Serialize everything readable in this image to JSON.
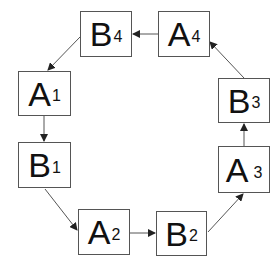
{
  "diagram": {
    "type": "cycle",
    "nodes": [
      {
        "id": "B4",
        "letter": "B",
        "sub": "4",
        "x": 80,
        "y": 11,
        "w": 52,
        "h": 46
      },
      {
        "id": "A4",
        "letter": "A",
        "sub": "4",
        "x": 158,
        "y": 11,
        "w": 52,
        "h": 46
      },
      {
        "id": "A1",
        "letter": "A",
        "sub": "1",
        "x": 18,
        "y": 71,
        "w": 53,
        "h": 45
      },
      {
        "id": "B1",
        "letter": "B",
        "sub": "1",
        "x": 18,
        "y": 142,
        "w": 53,
        "h": 46
      },
      {
        "id": "A2",
        "letter": "A",
        "sub": "2",
        "x": 78,
        "y": 209,
        "w": 52,
        "h": 46
      },
      {
        "id": "B2",
        "letter": "B",
        "sub": "2",
        "x": 156,
        "y": 211,
        "w": 51,
        "h": 45
      },
      {
        "id": "A3",
        "letter": "A",
        "sub": "3",
        "x": 218,
        "y": 146,
        "w": 52,
        "h": 47
      },
      {
        "id": "B3",
        "letter": "B",
        "sub": "3",
        "x": 218,
        "y": 78,
        "w": 52,
        "h": 45
      }
    ],
    "edges": [
      {
        "from": "A1",
        "to": "B1"
      },
      {
        "from": "B1",
        "to": "A2"
      },
      {
        "from": "A2",
        "to": "B2"
      },
      {
        "from": "B2",
        "to": "A3"
      },
      {
        "from": "A3",
        "to": "B3"
      },
      {
        "from": "B3",
        "to": "A4"
      },
      {
        "from": "A4",
        "to": "B4"
      },
      {
        "from": "B4",
        "to": "A1"
      }
    ],
    "colors": {
      "stroke": "#555555",
      "text": "#111111",
      "background": "#ffffff"
    }
  }
}
